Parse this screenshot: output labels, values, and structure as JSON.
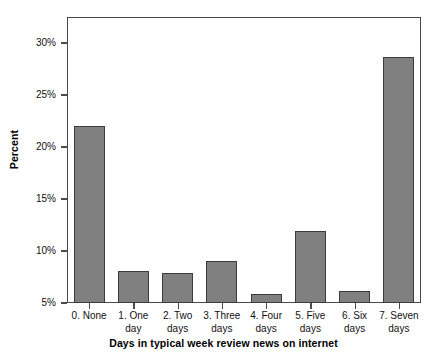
{
  "chart_data": {
    "type": "bar",
    "title": "",
    "xlabel": "Days in typical week review news on internet",
    "ylabel": "Percent",
    "categories": [
      "0. None",
      "1. One day",
      "2. Two days",
      "3. Three days",
      "4. Four days",
      "5. Five days",
      "6. Six days",
      "7. Seven days"
    ],
    "category_lines": [
      [
        "0. None"
      ],
      [
        "1. One",
        "day"
      ],
      [
        "2. Two",
        "days"
      ],
      [
        "3. Three",
        "days"
      ],
      [
        "4. Four",
        "days"
      ],
      [
        "5. Five",
        "days"
      ],
      [
        "6. Six",
        "days"
      ],
      [
        "7. Seven",
        "days"
      ]
    ],
    "values": [
      22.0,
      8.1,
      7.9,
      9.0,
      5.9,
      11.9,
      6.2,
      28.7
    ],
    "ylim": [
      5,
      32.5
    ],
    "yticks": [
      5,
      10,
      15,
      20,
      25,
      30
    ],
    "ytick_labels": [
      "5%",
      "10%",
      "15%",
      "20%",
      "25%",
      "30%"
    ],
    "grid": false,
    "legend": "none",
    "bar_fill_color": "#808080",
    "bar_edge_color": "#3b3b3b",
    "axis_color": "#4a4a4a",
    "background_color": "#ffffff"
  }
}
